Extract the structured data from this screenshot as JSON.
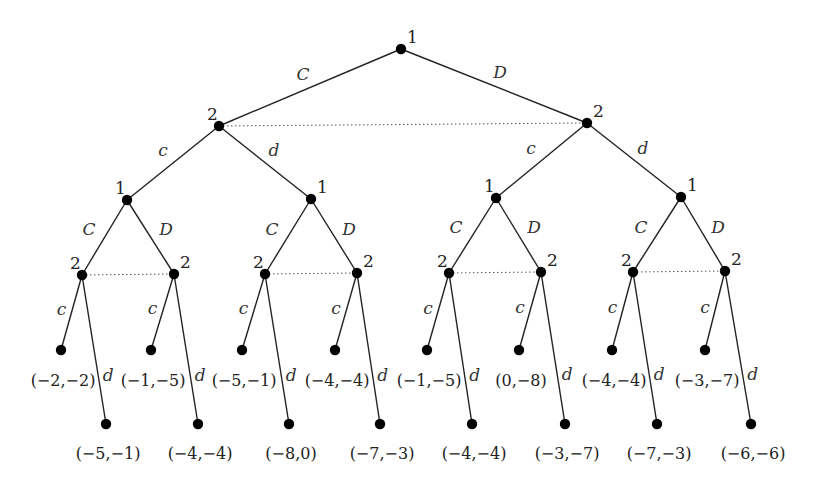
{
  "diagram": {
    "type": "extensive-form-game-tree",
    "colors": {
      "edge": "#222222",
      "node": "#000000",
      "info_set": "#555555",
      "text": "#222222"
    },
    "players": [
      "1",
      "2"
    ],
    "actions": {
      "player1": [
        "C",
        "D"
      ],
      "player2": [
        "c",
        "d"
      ]
    },
    "nodes": [
      {
        "id": "n0",
        "player": "1",
        "x": 401,
        "y": 49,
        "label_dx": 6,
        "label_dy": -6
      },
      {
        "id": "n1",
        "player": "2",
        "x": 219,
        "y": 126,
        "label_dx": -12,
        "label_dy": -6
      },
      {
        "id": "n2",
        "player": "2",
        "x": 587,
        "y": 123,
        "label_dx": 6,
        "label_dy": -6
      },
      {
        "id": "n3",
        "player": "1",
        "x": 127,
        "y": 200,
        "label_dx": -12,
        "label_dy": -6
      },
      {
        "id": "n4",
        "player": "1",
        "x": 311,
        "y": 199,
        "label_dx": 6,
        "label_dy": -6
      },
      {
        "id": "n5",
        "player": "1",
        "x": 496,
        "y": 198,
        "label_dx": -12,
        "label_dy": -6
      },
      {
        "id": "n6",
        "player": "1",
        "x": 681,
        "y": 197,
        "label_dx": 6,
        "label_dy": -6
      },
      {
        "id": "n7",
        "player": "2",
        "x": 82,
        "y": 275,
        "label_dx": -12,
        "label_dy": -6
      },
      {
        "id": "n8",
        "player": "2",
        "x": 174,
        "y": 274,
        "label_dx": 6,
        "label_dy": -6
      },
      {
        "id": "n9",
        "player": "2",
        "x": 265,
        "y": 274,
        "label_dx": -12,
        "label_dy": -6
      },
      {
        "id": "n10",
        "player": "2",
        "x": 357,
        "y": 273,
        "label_dx": 6,
        "label_dy": -6
      },
      {
        "id": "n11",
        "player": "2",
        "x": 449,
        "y": 273,
        "label_dx": -12,
        "label_dy": -6
      },
      {
        "id": "n12",
        "player": "2",
        "x": 541,
        "y": 272,
        "label_dx": 6,
        "label_dy": -6
      },
      {
        "id": "n13",
        "player": "2",
        "x": 633,
        "y": 272,
        "label_dx": -12,
        "label_dy": -6
      },
      {
        "id": "n14",
        "player": "2",
        "x": 725,
        "y": 271,
        "label_dx": 6,
        "label_dy": -6
      }
    ],
    "edges": [
      {
        "from": "n0",
        "to": "n1",
        "action": "C",
        "lx": 303,
        "ly": 80
      },
      {
        "from": "n0",
        "to": "n2",
        "action": "D",
        "lx": 500,
        "ly": 78
      },
      {
        "from": "n1",
        "to": "n3",
        "action": "c",
        "lx": 163,
        "ly": 156
      },
      {
        "from": "n1",
        "to": "n4",
        "action": "d",
        "lx": 274,
        "ly": 156
      },
      {
        "from": "n2",
        "to": "n5",
        "action": "c",
        "lx": 531,
        "ly": 154
      },
      {
        "from": "n2",
        "to": "n6",
        "action": "d",
        "lx": 643,
        "ly": 154
      },
      {
        "from": "n3",
        "to": "n7",
        "action": "C",
        "lx": 89,
        "ly": 235
      },
      {
        "from": "n3",
        "to": "n8",
        "action": "D",
        "lx": 166,
        "ly": 235
      },
      {
        "from": "n4",
        "to": "n9",
        "action": "C",
        "lx": 272,
        "ly": 235
      },
      {
        "from": "n4",
        "to": "n10",
        "action": "D",
        "lx": 349,
        "ly": 235
      },
      {
        "from": "n5",
        "to": "n11",
        "action": "C",
        "lx": 456,
        "ly": 233
      },
      {
        "from": "n5",
        "to": "n12",
        "action": "D",
        "lx": 534,
        "ly": 233
      },
      {
        "from": "n6",
        "to": "n13",
        "action": "C",
        "lx": 641,
        "ly": 233
      },
      {
        "from": "n6",
        "to": "n14",
        "action": "D",
        "lx": 718,
        "ly": 233
      }
    ],
    "information_sets": [
      {
        "player": "2",
        "nodes": [
          "n1",
          "n2"
        ]
      },
      {
        "player": "2",
        "nodes": [
          "n7",
          "n8"
        ]
      },
      {
        "player": "2",
        "nodes": [
          "n9",
          "n10"
        ]
      },
      {
        "player": "2",
        "nodes": [
          "n11",
          "n12"
        ]
      },
      {
        "player": "2",
        "nodes": [
          "n13",
          "n14"
        ]
      }
    ],
    "terminal_groups": [
      {
        "parent": "n7",
        "c_leaf": {
          "x": 61,
          "y": 350,
          "payoff": "(−2,−2)"
        },
        "d_leaf": {
          "x": 106,
          "y": 424,
          "payoff": "(−5,−1)"
        }
      },
      {
        "parent": "n8",
        "c_leaf": {
          "x": 151,
          "y": 350,
          "payoff": "(−1,−5)"
        },
        "d_leaf": {
          "x": 198,
          "y": 424,
          "payoff": "(−4,−4)"
        }
      },
      {
        "parent": "n9",
        "c_leaf": {
          "x": 242,
          "y": 350,
          "payoff": "(−5,−1)"
        },
        "d_leaf": {
          "x": 289,
          "y": 424,
          "payoff": "(−8,0)"
        }
      },
      {
        "parent": "n10",
        "c_leaf": {
          "x": 335,
          "y": 350,
          "payoff": "(−4,−4)"
        },
        "d_leaf": {
          "x": 380,
          "y": 424,
          "payoff": "(−7,−3)"
        }
      },
      {
        "parent": "n11",
        "c_leaf": {
          "x": 427,
          "y": 350,
          "payoff": "(−1,−5)"
        },
        "d_leaf": {
          "x": 472,
          "y": 424,
          "payoff": "(−4,−4)"
        }
      },
      {
        "parent": "n12",
        "c_leaf": {
          "x": 519,
          "y": 350,
          "payoff": "(0,−8)"
        },
        "d_leaf": {
          "x": 565,
          "y": 424,
          "payoff": "(−3,−7)"
        }
      },
      {
        "parent": "n13",
        "c_leaf": {
          "x": 612,
          "y": 350,
          "payoff": "(−4,−4)"
        },
        "d_leaf": {
          "x": 657,
          "y": 424,
          "payoff": "(−7,−3)"
        }
      },
      {
        "parent": "n14",
        "c_leaf": {
          "x": 705,
          "y": 350,
          "payoff": "(−3,−7)"
        },
        "d_leaf": {
          "x": 751,
          "y": 424,
          "payoff": "(−6,−6)"
        }
      }
    ],
    "leaf_action_labels": {
      "c": "c",
      "d": "d"
    },
    "payoffs_c_row": [
      "(−2,−2)",
      "(−1,−5)",
      "(−5,−1)",
      "(−4,−4)",
      "(−1,−5)",
      "(0,−8)",
      "(−4,−4)",
      "(−3,−7)"
    ],
    "payoffs_d_row": [
      "(−5,−1)",
      "(−4,−4)",
      "(−8,0)",
      "(−7,−3)",
      "(−4,−4)",
      "(−3,−7)",
      "(−7,−3)",
      "(−6,−6)"
    ]
  }
}
